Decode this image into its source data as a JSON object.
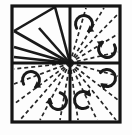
{
  "figure": {
    "background_color": "#fdfdfd",
    "ink_color": "#1a1a1a",
    "canvas": {
      "width": 132,
      "height": 135
    }
  },
  "frame": {
    "name": "outer-square-border",
    "x": 12,
    "y": 6,
    "width": 108,
    "height": 116,
    "stroke_color": "#141414",
    "stroke_width": 3.2
  },
  "focal_point": {
    "name": "convergence-point",
    "x": 70,
    "y": 63,
    "label": "center"
  },
  "divider_cross": {
    "name": "quadrant-divider-cross",
    "vertical_x": 70,
    "horizontal_y": 63,
    "stroke_color": "#141414",
    "stroke_width": 3.0
  },
  "quadrants": [
    {
      "id": "top-left",
      "line_style": "solid",
      "arrow_count": 0
    },
    {
      "id": "top-right",
      "line_style": "dashed",
      "arrow_count": 2
    },
    {
      "id": "bottom-left",
      "line_style": "dashed",
      "arrow_count": 2
    },
    {
      "id": "bottom-right",
      "line_style": "dashed",
      "arrow_count": 2
    }
  ],
  "solid_rays": {
    "name": "solid-fan-lines",
    "stroke_color": "#1a1a1a",
    "stroke_width": 2.6,
    "endpoints": [
      {
        "x": 55,
        "y": 7
      },
      {
        "x": 39,
        "y": 28
      },
      {
        "x": 14,
        "y": 47
      },
      {
        "x": 14,
        "y": 57
      },
      {
        "x": 14,
        "y": 31
      }
    ],
    "chord": {
      "x1": 14,
      "y1": 31,
      "x2": 55,
      "y2": 7
    }
  },
  "dashed_rays": {
    "name": "dashed-radial-lines",
    "stroke_color": "#262626",
    "stroke_width": 1.7,
    "dash_pattern": "4 3",
    "endpoints": [
      {
        "x": 86,
        "y": 8
      },
      {
        "x": 104,
        "y": 8
      },
      {
        "x": 118,
        "y": 14
      },
      {
        "x": 118,
        "y": 34
      },
      {
        "x": 118,
        "y": 52
      },
      {
        "x": 118,
        "y": 76
      },
      {
        "x": 118,
        "y": 100
      },
      {
        "x": 116,
        "y": 120
      },
      {
        "x": 97,
        "y": 120
      },
      {
        "x": 78,
        "y": 120
      },
      {
        "x": 60,
        "y": 120
      },
      {
        "x": 40,
        "y": 120
      },
      {
        "x": 20,
        "y": 120
      },
      {
        "x": 14,
        "y": 104
      },
      {
        "x": 14,
        "y": 84
      },
      {
        "x": 14,
        "y": 69
      }
    ]
  },
  "rotation_arrows": [
    {
      "id": "arrow-tr-upper",
      "quadrant": "top-right",
      "center": {
        "x": 84,
        "y": 24
      },
      "radius": 8.5,
      "direction": "clockwise",
      "head_position": "lower-right"
    },
    {
      "id": "arrow-tr-lower",
      "quadrant": "top-right",
      "center": {
        "x": 107,
        "y": 49
      },
      "radius": 8.5,
      "direction": "clockwise",
      "head_position": "upper-left"
    },
    {
      "id": "arrow-bl-upper",
      "quadrant": "bottom-left",
      "center": {
        "x": 31,
        "y": 80
      },
      "radius": 8.5,
      "direction": "clockwise",
      "head_position": "lower-right"
    },
    {
      "id": "arrow-bl-lower",
      "quadrant": "bottom-left",
      "center": {
        "x": 58,
        "y": 101
      },
      "radius": 8.5,
      "direction": "clockwise",
      "head_position": "left"
    },
    {
      "id": "arrow-br-lower",
      "quadrant": "bottom-right",
      "center": {
        "x": 83,
        "y": 100
      },
      "radius": 8.5,
      "direction": "clockwise",
      "head_position": "upper-right"
    },
    {
      "id": "arrow-br-upper",
      "quadrant": "bottom-right",
      "center": {
        "x": 107,
        "y": 78
      },
      "radius": 8.5,
      "direction": "clockwise",
      "head_position": "lower-left"
    }
  ]
}
